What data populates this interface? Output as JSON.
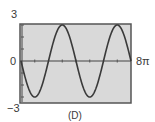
{
  "chart_data": {
    "type": "line",
    "title": "",
    "caption": "(D)",
    "function": "y = -3 sin(x/2)",
    "xlabel": "",
    "ylabel": "",
    "xlim": [
      0,
      "8π"
    ],
    "ylim": [
      -3,
      3
    ],
    "tick_labels": {
      "y_top": "3",
      "y_bottom": "−3",
      "origin": "0",
      "x_right": "8π"
    },
    "x_ticks_count": 8,
    "grid": false,
    "legend": null,
    "x": [
      "0",
      "π",
      "2π",
      "3π",
      "4π",
      "5π",
      "6π",
      "7π",
      "8π"
    ],
    "series": [
      {
        "name": "curve",
        "values": [
          0,
          -2.12,
          0,
          2.12,
          0,
          -2.12,
          0,
          2.12,
          0
        ]
      }
    ],
    "extrema": {
      "min_x": [
        "π",
        "5π"
      ],
      "max_x": [
        "3π",
        "7π"
      ],
      "min": -3,
      "max": 3
    },
    "colors": {
      "plot_bg": "#d9d9d9",
      "frame": "#555555",
      "curve": "#3a3a3a",
      "axis": "#444444"
    }
  }
}
